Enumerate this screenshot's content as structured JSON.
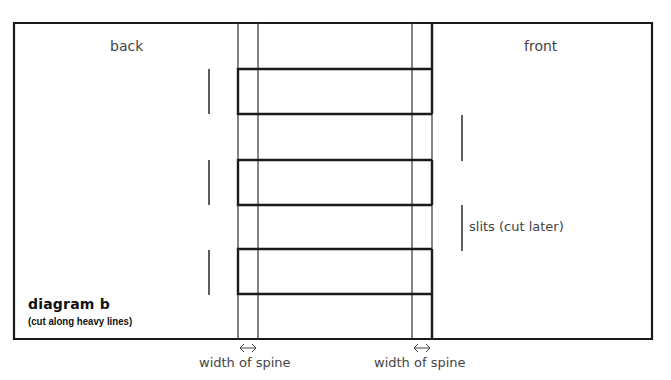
{
  "diagram": {
    "title": "diagram b",
    "subtitle": "(cut along heavy lines)",
    "panels": {
      "back_label": "back",
      "front_label": "front"
    },
    "annotations": {
      "slits_label": "slits (cut later)",
      "spine_left_label": "width of spine",
      "spine_right_label": "width of spine",
      "spine_arrow_icon": "double-headed-arrow"
    },
    "colors": {
      "heavy_line": "#1a1a1a",
      "thin_line": "#333333",
      "text": "#444444",
      "background": "#ffffff"
    },
    "geometry": {
      "outer_rect": {
        "x": 14,
        "y": 23,
        "x2": 652,
        "y2": 339
      },
      "spine_lines_x": [
        238,
        258,
        412,
        432
      ],
      "strips": [
        {
          "y_top": 69,
          "y_bottom": 114
        },
        {
          "y_top": 160,
          "y_bottom": 205
        },
        {
          "y_top": 249,
          "y_bottom": 294
        }
      ],
      "back_slits": [
        {
          "x": 209,
          "y1": 69,
          "y2": 114
        },
        {
          "x": 209,
          "y1": 160,
          "y2": 205
        },
        {
          "x": 209,
          "y1": 250,
          "y2": 295
        }
      ],
      "front_slits": [
        {
          "x": 462,
          "y1": 115,
          "y2": 161
        },
        {
          "x": 462,
          "y1": 205,
          "y2": 251
        }
      ]
    }
  }
}
